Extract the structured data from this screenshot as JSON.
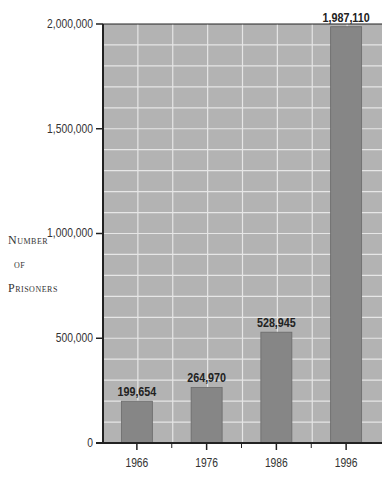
{
  "chart_data": {
    "type": "bar",
    "title": "",
    "xlabel": "",
    "ylabel": "Number of Prisoners",
    "categories": [
      "1966",
      "1976",
      "1986",
      "1996"
    ],
    "values": [
      199654,
      264970,
      528945,
      1987110
    ],
    "value_labels": [
      "199,654",
      "264,970",
      "528,945",
      "1,987,110"
    ],
    "ylim": [
      0,
      2000000
    ],
    "yticks": [
      0,
      500000,
      1000000,
      1500000,
      2000000
    ],
    "ytick_labels": [
      "0",
      "500,000",
      "1,000,000",
      "1,500,000",
      "2,000,000"
    ],
    "grid": true,
    "legend": null
  },
  "ylabel_lines": [
    "Number",
    "of",
    "Prisoners"
  ],
  "colors": {
    "plot_bg": "#b3b3b3",
    "grid": "#e6e6e6",
    "bar": "#868686",
    "bar_edge": "#6a6a6a",
    "axis": "#222222",
    "text": "#333333"
  }
}
